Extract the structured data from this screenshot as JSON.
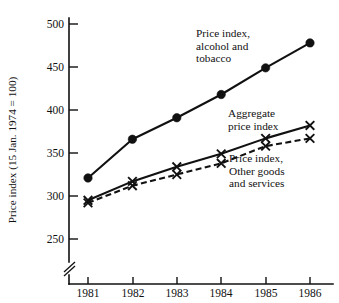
{
  "chart_data": {
    "type": "line",
    "title": "",
    "xlabel": "",
    "ylabel": "Price index (15 Jan. 1974 = 100)",
    "x": [
      "1981",
      "1982",
      "1983",
      "1984",
      "1985",
      "1986"
    ],
    "categories": [
      "1981",
      "1982",
      "1983",
      "1984",
      "1985",
      "1986"
    ],
    "xtick_labels": [
      "1981",
      "1982",
      "1983",
      "1984",
      "1985",
      "1986"
    ],
    "ytick_labels": [
      "250",
      "300",
      "350",
      "400",
      "450",
      "500"
    ],
    "yticks": [
      250,
      300,
      350,
      400,
      450,
      500
    ],
    "ylim": [
      238,
      510
    ],
    "y_axis_broken": true,
    "grid": false,
    "legend_position": "inline-annotations",
    "series": [
      {
        "name": "Price index, alcohol and tobacco",
        "marker": "filled-circle",
        "linestyle": "solid",
        "color": "#111111",
        "values": [
          321,
          366,
          391,
          418,
          449,
          478
        ]
      },
      {
        "name": "Aggregate price index",
        "marker": "x",
        "linestyle": "solid",
        "color": "#111111",
        "values": [
          295,
          317,
          334,
          349,
          367,
          382
        ]
      },
      {
        "name": "Price index, Other goods and services",
        "marker": "x",
        "linestyle": "dashed",
        "color": "#111111",
        "values": [
          292,
          312,
          325,
          338,
          358,
          367
        ]
      }
    ],
    "annotations": [
      {
        "id": "alcohol",
        "lines": [
          "Price index,",
          "alcohol and",
          "tobacco"
        ]
      },
      {
        "id": "aggregate",
        "lines": [
          "Aggregate",
          "price index"
        ]
      },
      {
        "id": "other",
        "lines": [
          "Price index,",
          "Other goods",
          "and services"
        ]
      }
    ]
  },
  "axis": {
    "y_title": "Price index (15 Jan. 1974 = 100)",
    "y_ticks": [
      "500",
      "450",
      "400",
      "350",
      "300",
      "250"
    ],
    "x_ticks": [
      "1981",
      "1982",
      "1983",
      "1984",
      "1985",
      "1986"
    ]
  },
  "annotations": {
    "alcohol_line1": "Price index,",
    "alcohol_line2": "alcohol and",
    "alcohol_line3": "tobacco",
    "aggregate_line1": "Aggregate",
    "aggregate_line2": "price index",
    "other_line1": "Price index,",
    "other_line2": "Other goods",
    "other_line3": "and services"
  },
  "colors": {
    "ink": "#111111",
    "background": "#ffffff"
  }
}
